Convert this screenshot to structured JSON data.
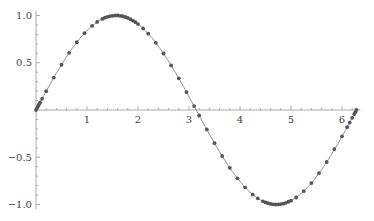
{
  "chart_data": {
    "type": "line",
    "title": "",
    "xlabel": "",
    "ylabel": "",
    "function": "sin(x)",
    "xlim": [
      0,
      6.283
    ],
    "ylim": [
      -1.0,
      1.0
    ],
    "grid": false,
    "legend": null,
    "x_ticks": [
      1,
      2,
      3,
      4,
      5,
      6
    ],
    "x_tick_labels": [
      "1",
      "2",
      "3",
      "4",
      "5",
      "6"
    ],
    "y_ticks": [
      1.0,
      0.5,
      -0.5,
      -1.0
    ],
    "y_tick_labels": [
      "1.0",
      "0.5",
      "-0.5",
      "-1.0"
    ],
    "series": [
      {
        "name": "sin(x)",
        "line_color": "#888888",
        "marker_color": "#555555",
        "x": [
          0.0,
          0.02,
          0.04,
          0.06,
          0.08,
          0.12,
          0.2,
          0.35,
          0.5,
          0.65,
          0.8,
          0.95,
          1.1,
          1.2,
          1.3,
          1.35,
          1.4,
          1.45,
          1.5,
          1.55,
          1.6,
          1.65,
          1.7,
          1.75,
          1.8,
          1.85,
          1.9,
          1.95,
          2.0,
          2.1,
          2.2,
          2.35,
          2.5,
          2.65,
          2.8,
          2.95,
          3.1,
          3.2,
          3.35,
          3.5,
          3.65,
          3.8,
          3.95,
          4.1,
          4.25,
          4.35,
          4.45,
          4.5,
          4.55,
          4.6,
          4.65,
          4.7,
          4.75,
          4.8,
          4.85,
          4.9,
          4.95,
          5.0,
          5.1,
          5.25,
          5.4,
          5.55,
          5.7,
          5.85,
          6.0,
          6.1,
          6.15,
          6.2,
          6.24,
          6.26,
          6.283
        ],
        "y": [
          0.0,
          0.02,
          0.04,
          0.06,
          0.08,
          0.12,
          0.199,
          0.343,
          0.479,
          0.605,
          0.717,
          0.813,
          0.891,
          0.932,
          0.964,
          0.976,
          0.985,
          0.993,
          0.997,
          1.0,
          1.0,
          0.997,
          0.992,
          0.984,
          0.974,
          0.961,
          0.946,
          0.929,
          0.909,
          0.863,
          0.808,
          0.711,
          0.598,
          0.472,
          0.335,
          0.19,
          0.042,
          -0.058,
          -0.206,
          -0.351,
          -0.487,
          -0.612,
          -0.723,
          -0.818,
          -0.895,
          -0.936,
          -0.966,
          -0.978,
          -0.987,
          -0.994,
          -0.998,
          -1.0,
          -0.999,
          -0.996,
          -0.99,
          -0.982,
          -0.971,
          -0.959,
          -0.926,
          -0.859,
          -0.773,
          -0.667,
          -0.55,
          -0.414,
          -0.279,
          -0.182,
          -0.133,
          -0.083,
          -0.043,
          -0.023,
          0.0
        ]
      }
    ]
  }
}
